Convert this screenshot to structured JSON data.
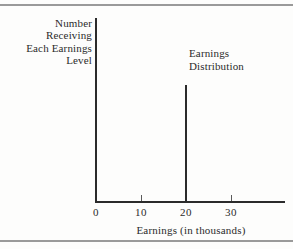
{
  "figure": {
    "background_color": "#fdfdfc",
    "ink_color": "#2b2b2b",
    "rule_color": "#9a9a9a"
  },
  "ylabel": {
    "lines": [
      "Number",
      "Receiving",
      "Each Earnings",
      "Level"
    ]
  },
  "annotation": {
    "lines": [
      "Earnings",
      "Distribution"
    ]
  },
  "xtitle": "Earnings (in thousands)",
  "ticks": [
    {
      "label": "0",
      "value": 0
    },
    {
      "label": "10",
      "value": 10
    },
    {
      "label": "20",
      "value": 20
    },
    {
      "label": "30",
      "value": 30
    }
  ],
  "chart_data": {
    "type": "bar",
    "title": "",
    "subtitle": "",
    "xlabel": "Earnings (in thousands)",
    "ylabel": "Number Receiving Each Earnings Level",
    "xlim": [
      0,
      42
    ],
    "ylim": [
      0,
      1
    ],
    "xticks": [
      0,
      10,
      20,
      30
    ],
    "xticklabels": [
      "0",
      "10",
      "20",
      "30"
    ],
    "yticks": [],
    "yticklabels": [],
    "grid": false,
    "legend": false,
    "annotations": [
      {
        "text": "Earnings Distribution",
        "x": 22,
        "y": 0.83
      }
    ],
    "series": [
      {
        "name": "Earnings Distribution",
        "categories": [
          20
        ],
        "values": [
          0.635
        ],
        "note": "single degenerate spike: all workers earn exactly 20 thousand"
      }
    ]
  }
}
